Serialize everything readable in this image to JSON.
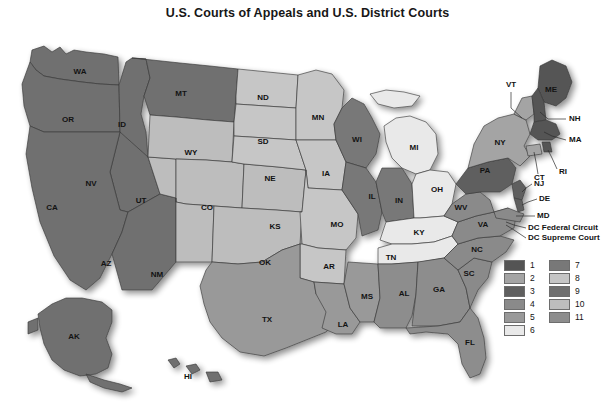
{
  "title": "U.S. Courts of Appeals and U.S. District Courts",
  "map": {
    "name": "united-states-judicial-circuits-map",
    "dc_notes": [
      "DC Federal Circuit",
      "DC Supreme Court"
    ],
    "states": [
      {
        "code": "WA",
        "circuit": 9,
        "fill": "#6f6f6f",
        "label_x": 80,
        "label_y": 50
      },
      {
        "code": "OR",
        "circuit": 9,
        "fill": "#6f6f6f",
        "label_x": 68,
        "label_y": 98
      },
      {
        "code": "ID",
        "circuit": 9,
        "fill": "#6f6f6f",
        "label_x": 122,
        "label_y": 103
      },
      {
        "code": "MT",
        "circuit": 9,
        "fill": "#6f6f6f",
        "label_x": 181,
        "label_y": 72
      },
      {
        "code": "NV",
        "circuit": 9,
        "fill": "#6f6f6f",
        "label_x": 91,
        "label_y": 162
      },
      {
        "code": "CA",
        "circuit": 9,
        "fill": "#6f6f6f",
        "label_x": 52,
        "label_y": 186
      },
      {
        "code": "AZ",
        "circuit": 9,
        "fill": "#6f6f6f",
        "label_x": 106,
        "label_y": 242
      },
      {
        "code": "AK",
        "circuit": 9,
        "fill": "#6f6f6f",
        "label_x": 74,
        "label_y": 315
      },
      {
        "code": "HI",
        "circuit": 9,
        "fill": "#6f6f6f",
        "label_x": 188,
        "label_y": 355
      },
      {
        "code": "UT",
        "circuit": 10,
        "fill": "#bdbdbd",
        "label_x": 141,
        "label_y": 179
      },
      {
        "code": "WY",
        "circuit": 10,
        "fill": "#bdbdbd",
        "label_x": 191,
        "label_y": 131
      },
      {
        "code": "CO",
        "circuit": 10,
        "fill": "#bdbdbd",
        "label_x": 207,
        "label_y": 186
      },
      {
        "code": "NM",
        "circuit": 10,
        "fill": "#bdbdbd",
        "label_x": 157,
        "label_y": 253
      },
      {
        "code": "KS",
        "circuit": 10,
        "fill": "#bdbdbd",
        "label_x": 275,
        "label_y": 205
      },
      {
        "code": "OK",
        "circuit": 10,
        "fill": "#bdbdbd",
        "label_x": 265,
        "label_y": 241
      },
      {
        "code": "ND",
        "circuit": 8,
        "fill": "#c6c6c6",
        "label_x": 263,
        "label_y": 76
      },
      {
        "code": "SD",
        "circuit": 8,
        "fill": "#c6c6c6",
        "label_x": 263,
        "label_y": 120
      },
      {
        "code": "NE",
        "circuit": 8,
        "fill": "#c6c6c6",
        "label_x": 270,
        "label_y": 157
      },
      {
        "code": "MN",
        "circuit": 8,
        "fill": "#c6c6c6",
        "label_x": 318,
        "label_y": 96
      },
      {
        "code": "IA",
        "circuit": 8,
        "fill": "#c6c6c6",
        "label_x": 326,
        "label_y": 152
      },
      {
        "code": "MO",
        "circuit": 8,
        "fill": "#c6c6c6",
        "label_x": 337,
        "label_y": 203
      },
      {
        "code": "AR",
        "circuit": 8,
        "fill": "#c6c6c6",
        "label_x": 329,
        "label_y": 245
      },
      {
        "code": "TX",
        "circuit": 5,
        "fill": "#999999",
        "label_x": 267,
        "label_y": 298
      },
      {
        "code": "LA",
        "circuit": 5,
        "fill": "#999999",
        "label_x": 343,
        "label_y": 303
      },
      {
        "code": "MS",
        "circuit": 5,
        "fill": "#999999",
        "label_x": 367,
        "label_y": 275
      },
      {
        "code": "WI",
        "circuit": 7,
        "fill": "#787878",
        "label_x": 357,
        "label_y": 118
      },
      {
        "code": "IL",
        "circuit": 7,
        "fill": "#787878",
        "label_x": 372,
        "label_y": 175
      },
      {
        "code": "IN",
        "circuit": 7,
        "fill": "#787878",
        "label_x": 399,
        "label_y": 179
      },
      {
        "code": "MI",
        "circuit": 6,
        "fill": "#e9e9e9",
        "label_x": 414,
        "label_y": 126
      },
      {
        "code": "OH",
        "circuit": 6,
        "fill": "#e9e9e9",
        "label_x": 437,
        "label_y": 168
      },
      {
        "code": "KY",
        "circuit": 6,
        "fill": "#e9e9e9",
        "label_x": 419,
        "label_y": 211
      },
      {
        "code": "TN",
        "circuit": 6,
        "fill": "#e9e9e9",
        "label_x": 391,
        "label_y": 236
      },
      {
        "code": "AL",
        "circuit": 11,
        "fill": "#8d8d8d",
        "label_x": 404,
        "label_y": 272
      },
      {
        "code": "GA",
        "circuit": 11,
        "fill": "#8d8d8d",
        "label_x": 439,
        "label_y": 268
      },
      {
        "code": "FL",
        "circuit": 11,
        "fill": "#8d8d8d",
        "label_x": 470,
        "label_y": 321
      },
      {
        "code": "SC",
        "circuit": 4,
        "fill": "#8a8a8a",
        "label_x": 469,
        "label_y": 252
      },
      {
        "code": "NC",
        "circuit": 4,
        "fill": "#8a8a8a",
        "label_x": 477,
        "label_y": 228
      },
      {
        "code": "VA",
        "circuit": 4,
        "fill": "#8a8a8a",
        "label_x": 483,
        "label_y": 203
      },
      {
        "code": "WV",
        "circuit": 4,
        "fill": "#8a8a8a",
        "label_x": 461,
        "label_y": 186
      },
      {
        "code": "PA",
        "circuit": 3,
        "fill": "#5f5f5f",
        "label_x": 485,
        "label_y": 149
      },
      {
        "code": "NY",
        "circuit": 2,
        "fill": "#a4a4a4",
        "label_x": 500,
        "label_y": 121
      },
      {
        "code": "ME",
        "circuit": 1,
        "fill": "#545454",
        "label_x": 551,
        "label_y": 68
      }
    ],
    "callouts": [
      {
        "code": "VT",
        "circuit": 2,
        "x": 511,
        "y": 63,
        "anchor": "middle"
      },
      {
        "code": "NH",
        "circuit": 1,
        "x": 569,
        "y": 97,
        "anchor": "start"
      },
      {
        "code": "MA",
        "circuit": 1,
        "x": 569,
        "y": 118,
        "anchor": "start"
      },
      {
        "code": "RI",
        "circuit": 1,
        "x": 559,
        "y": 150,
        "anchor": "start"
      },
      {
        "code": "CT",
        "circuit": 2,
        "x": 534,
        "y": 156,
        "anchor": "start"
      },
      {
        "code": "NJ",
        "circuit": 3,
        "x": 534,
        "y": 162,
        "anchor": "start"
      },
      {
        "code": "DE",
        "circuit": 3,
        "x": 539,
        "y": 177,
        "anchor": "start"
      },
      {
        "code": "MD",
        "circuit": 4,
        "x": 537,
        "y": 194,
        "anchor": "start"
      }
    ]
  },
  "legend": {
    "name": "circuit-legend",
    "left_column": [
      {
        "num": "1",
        "fill": "#545454"
      },
      {
        "num": "2",
        "fill": "#a4a4a4"
      },
      {
        "num": "3",
        "fill": "#5f5f5f"
      },
      {
        "num": "4",
        "fill": "#8a8a8a"
      },
      {
        "num": "5",
        "fill": "#999999"
      },
      {
        "num": "6",
        "fill": "#e9e9e9"
      }
    ],
    "right_column": [
      {
        "num": "7",
        "fill": "#787878"
      },
      {
        "num": "8",
        "fill": "#c6c6c6"
      },
      {
        "num": "9",
        "fill": "#6f6f6f"
      },
      {
        "num": "10",
        "fill": "#bdbdbd"
      },
      {
        "num": "11",
        "fill": "#8d8d8d"
      }
    ]
  },
  "colors": {
    "background": "#ffffff",
    "border": "#3a3a3a",
    "text": "#131313"
  }
}
